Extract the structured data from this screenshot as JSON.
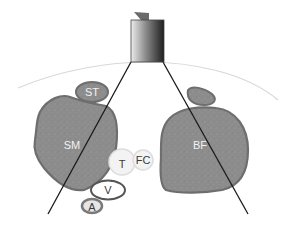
{
  "diagram": {
    "type": "ultrasound-cross-section-schematic",
    "colors": {
      "muscle_fill": "#8c8c8c",
      "muscle_stroke": "#6e6e6e",
      "skin_line": "#d8d8d8",
      "beam_line": "#1a1a1a",
      "probe_light": "#e8e8e8",
      "probe_dark": "#202020",
      "vessel_stroke": "#555555",
      "nerve_fill": "#f3f3f3",
      "nerve_stroke": "#dcdcdc"
    },
    "elements": {
      "probe": {
        "label": ""
      },
      "semitendinosus": {
        "label": "ST"
      },
      "semimembranosus": {
        "label": "SM"
      },
      "biceps_femoris_short": {
        "label": ""
      },
      "biceps_femoris": {
        "label": "BF"
      },
      "tibial_nerve": {
        "label": "T"
      },
      "common_fibular_nerve": {
        "label": "FC"
      },
      "vein": {
        "label": "V"
      },
      "artery": {
        "label": "A"
      }
    }
  }
}
